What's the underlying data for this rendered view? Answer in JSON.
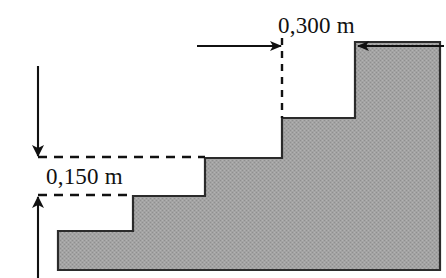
{
  "figure": {
    "kind": "engineering-section-diagram",
    "background_color": "#ffffff",
    "fill_color": "#a3a3a3",
    "fill_texture": "dithered-halftone",
    "outline_color": "#2b2b2b",
    "annotation_color": "#111111",
    "canvas": {
      "width": 446,
      "height": 278
    }
  },
  "labels": {
    "horizontal_dimension": "0,300 m",
    "vertical_dimension": "0,150 m"
  },
  "label_positions": {
    "horizontal_dimension": {
      "x": 278,
      "y": 33
    },
    "vertical_dimension": {
      "x": 46,
      "y": 184
    }
  },
  "geometry": {
    "solid_outline_points": "440,42 355,42 355,118 282,118 282,158 205,158 205,196 133,196 133,231 58,231 58,270 440,270",
    "steps": [
      {
        "name": "top-step",
        "riser_x": 355,
        "tread_y": 42
      },
      {
        "name": "upper-step",
        "riser_x": 282,
        "tread_y": 118
      },
      {
        "name": "middle-step",
        "riser_x": 205,
        "tread_y": 158
      },
      {
        "name": "lower-step",
        "riser_x": 133,
        "tread_y": 196
      },
      {
        "name": "base-slab",
        "riser_x": 58,
        "tread_y": 231
      }
    ]
  },
  "annotations": {
    "horizontal_leader": {
      "name": "0,300 m span arrow",
      "y": 46,
      "x_start": 197,
      "x_end": 282,
      "direction": "right"
    },
    "right_leader": {
      "name": "right edge arrow",
      "y": 46,
      "x_start": 444,
      "x_end": 357,
      "direction": "left"
    },
    "vertical_dashed_tick": {
      "x": 282,
      "y_start": 38,
      "y_end": 118
    },
    "upper_dashed_line": {
      "y": 157,
      "x_start": 38,
      "x_end": 205
    },
    "lower_dashed_line": {
      "y": 195,
      "x_start": 38,
      "x_end": 133
    },
    "down_leader": {
      "name": "0,150 m upper arrow",
      "x": 38,
      "y_start": 66,
      "y_end": 157,
      "direction": "down"
    },
    "up_leader": {
      "name": "0,150 m lower arrow",
      "x": 38,
      "y_start": 278,
      "y_end": 196,
      "direction": "up"
    }
  }
}
